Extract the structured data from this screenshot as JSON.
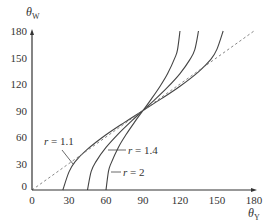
{
  "chart_data": {
    "type": "line",
    "title": "",
    "xlabel": "θY",
    "ylabel": "θW",
    "xlim": [
      0,
      180
    ],
    "ylim": [
      0,
      180
    ],
    "x_ticks": [
      0,
      30,
      60,
      90,
      120,
      150,
      180
    ],
    "y_ticks": [
      0,
      30,
      60,
      90,
      120,
      150,
      180
    ],
    "grid": false,
    "legend": "inline labels with leader lines",
    "series": [
      {
        "name": "r = 1.1",
        "style": "solid",
        "color": "#444444",
        "points": [
          [
            25,
            0
          ],
          [
            30,
            20.5
          ],
          [
            35,
            32.2
          ],
          [
            45,
            46.2
          ],
          [
            60,
            62.5
          ],
          [
            75,
            76.6
          ],
          [
            90,
            90
          ],
          [
            105,
            103.4
          ],
          [
            120,
            117.5
          ],
          [
            135,
            133.8
          ],
          [
            145,
            147.8
          ],
          [
            150,
            159.5
          ],
          [
            155,
            180
          ]
        ]
      },
      {
        "name": "r = 1.4",
        "style": "solid",
        "color": "#444444",
        "points": [
          [
            45,
            0
          ],
          [
            48,
            21.0
          ],
          [
            52,
            32.4
          ],
          [
            60,
            48.2
          ],
          [
            70,
            63.6
          ],
          [
            80,
            77.2
          ],
          [
            90,
            90
          ],
          [
            100,
            102.8
          ],
          [
            110,
            116.4
          ],
          [
            120,
            131.8
          ],
          [
            128,
            147.6
          ],
          [
            132,
            159.0
          ],
          [
            135,
            180
          ]
        ]
      },
      {
        "name": "r = 2",
        "style": "solid",
        "color": "#444444",
        "points": [
          [
            60,
            0
          ],
          [
            62,
            21.0
          ],
          [
            64,
            29.9
          ],
          [
            70,
            48.2
          ],
          [
            76,
            62.2
          ],
          [
            83,
            76.5
          ],
          [
            90,
            90
          ],
          [
            97,
            103.5
          ],
          [
            104,
            117.8
          ],
          [
            110,
            131.8
          ],
          [
            116,
            150.1
          ],
          [
            118,
            159.0
          ],
          [
            120,
            180
          ]
        ]
      },
      {
        "name": "θW = θY",
        "style": "dashed",
        "color": "#777777",
        "points": [
          [
            0,
            0
          ],
          [
            180,
            180
          ]
        ]
      }
    ],
    "annotations": [
      {
        "text": "r = 1.1",
        "target_series": "r = 1.1",
        "label_at": [
          18,
          68
        ]
      },
      {
        "text": "r = 1.4",
        "target_series": "r = 1.4",
        "label_at": [
          68,
          60
        ]
      },
      {
        "text": "r = 2",
        "target_series": "r = 2",
        "label_at": [
          72,
          32
        ]
      }
    ]
  },
  "labels": {
    "x_axis_main": "θ",
    "x_axis_sub": "Y",
    "y_axis_main": "θ",
    "y_axis_sub": "W",
    "r11_var": "r",
    "r11_rest": " = 1.1",
    "r14_var": "r",
    "r14_rest": " = 1.4",
    "r2_var": "r",
    "r2_rest": " = 2"
  }
}
